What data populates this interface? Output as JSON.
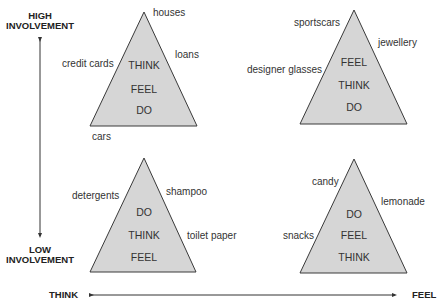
{
  "axes": {
    "vertical": {
      "top": "HIGH\nINVOLVEMENT",
      "top_line1": "HIGH",
      "top_line2": "INVOLVEMENT",
      "bottom_line1": "LOW",
      "bottom_line2": "INVOLVEMENT"
    },
    "horizontal": {
      "left": "THINK",
      "right": "FEEL"
    }
  },
  "quadrants": [
    {
      "position": "top-left",
      "sequence": [
        "THINK",
        "FEEL",
        "DO"
      ],
      "products": [
        "houses",
        "loans",
        "credit cards",
        "cars"
      ]
    },
    {
      "position": "top-right",
      "sequence": [
        "FEEL",
        "THINK",
        "DO"
      ],
      "products": [
        "sportscars",
        "jewellery",
        "designer glasses"
      ]
    },
    {
      "position": "bottom-left",
      "sequence": [
        "DO",
        "THINK",
        "FEEL"
      ],
      "products": [
        "detergents",
        "shampoo",
        "toilet paper"
      ]
    },
    {
      "position": "bottom-right",
      "sequence": [
        "DO",
        "FEEL",
        "THINK"
      ],
      "products": [
        "candy",
        "lemonade",
        "snacks"
      ]
    }
  ],
  "colors": {
    "triangle_fill": "#d6d6d6",
    "stroke": "#3a3a3a"
  }
}
